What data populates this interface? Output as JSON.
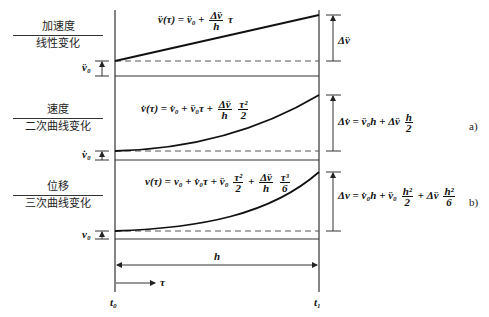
{
  "diagram": {
    "panels": [
      {
        "id": "acceleration",
        "label_top": "加速度",
        "label_bottom": "线性变化",
        "initial_label": "v̈₀",
        "formula": "v̈(τ) = v̈₀ + (Δv̈/h) τ",
        "formula_parts": {
          "lhs": "v̈(τ)",
          "eq": "=",
          "t1": "v̈₀",
          "plus": "+",
          "num": "Δv̈",
          "den": "h",
          "tail": "τ"
        },
        "delta_label": "Δv̈",
        "tag": ""
      },
      {
        "id": "velocity",
        "label_top": "速度",
        "label_bottom": "二次曲线变化",
        "initial_label": "v̇₀",
        "formula": "v̇(τ) = v̇₀ + v̈₀τ + (Δv̈/h)(τ²/2)",
        "formula_parts": {
          "lhs": "v̇(τ)",
          "eq": "=",
          "t1": "v̇₀",
          "p1": "+",
          "t2": "v̈₀τ",
          "p2": "+",
          "num1": "Δv̈",
          "den1": "h",
          "num2": "τ²",
          "den2": "2"
        },
        "delta_label": "Δv̇ = v̈₀h + Δv̈ (h/2)",
        "delta_parts": {
          "lhs": "Δv̇",
          "eq": "=",
          "t1": "v̈₀h",
          "plus": "+",
          "t2": "Δv̈",
          "num": "h",
          "den": "2"
        },
        "tag": "a)"
      },
      {
        "id": "displacement",
        "label_top": "位移",
        "label_bottom": "三次曲线变化",
        "initial_label": "v₀",
        "formula": "v(τ) = v₀ + v̇₀τ + v̈₀(τ²/2) + (Δv̈/h)(τ³/6)",
        "formula_parts": {
          "lhs": "v(τ)",
          "eq": "=",
          "t1": "v₀",
          "p1": "+",
          "t2": "v̇₀τ",
          "p2": "+",
          "t3": "v̈₀",
          "num1": "τ²",
          "den1": "2",
          "p3": "+",
          "num2": "Δv̈",
          "den2": "h",
          "num3": "τ³",
          "den3": "6"
        },
        "delta_label": "Δv = v̇₀h + v̈₀(h²/2) + Δv̈(h²/6)",
        "delta_parts": {
          "lhs": "Δv",
          "eq": "=",
          "t1": "v̇₀h",
          "p1": "+",
          "t2": "v̈₀",
          "num1": "h²",
          "den1": "2",
          "p2": "+",
          "t3": "Δv̈",
          "num2": "h²",
          "den2": "6"
        },
        "tag": "b)"
      }
    ],
    "interval_label": "h",
    "time_arrow_label": "τ",
    "t_start": "t₀",
    "t_end": "t₁",
    "colors": {
      "line": "#1a1a1a",
      "dashed": "#555555",
      "guide": "#444444"
    }
  }
}
